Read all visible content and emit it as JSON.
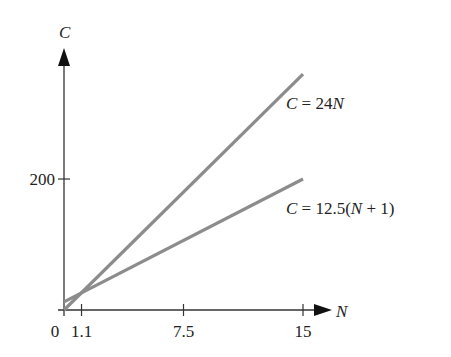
{
  "chart_data": {
    "type": "line",
    "title": "",
    "xlabel": "N",
    "ylabel": "C",
    "xlim": [
      0,
      17.5
    ],
    "ylim": [
      0,
      400
    ],
    "grid": false,
    "x_ticks": [
      {
        "value": 0,
        "label": "0"
      },
      {
        "value": 1.1,
        "label": "1.1"
      },
      {
        "value": 7.5,
        "label": "7.5"
      },
      {
        "value": 15,
        "label": "15"
      }
    ],
    "y_ticks": [
      {
        "value": 200,
        "label": "200"
      }
    ],
    "series": [
      {
        "name": "C = 24N",
        "x": [
          0,
          15
        ],
        "values": [
          0,
          360
        ],
        "color": "#8c8c8c"
      },
      {
        "name": "C = 12.5(N + 1)",
        "x": [
          0,
          15
        ],
        "values": [
          12.5,
          200
        ],
        "color": "#8c8c8c"
      }
    ],
    "annotations": [
      {
        "text": "C = 24N",
        "near_series": 0
      },
      {
        "text": "C = 12.5(N + 1)",
        "near_series": 1
      }
    ]
  },
  "labels": {
    "y_axis": "C",
    "x_axis": "N",
    "line1_c": "C",
    "line1_rest": " = 24",
    "line1_n": "N",
    "line2_c": "C",
    "line2_mid": " = 12.5(",
    "line2_n": "N",
    "line2_end": " + 1)"
  }
}
